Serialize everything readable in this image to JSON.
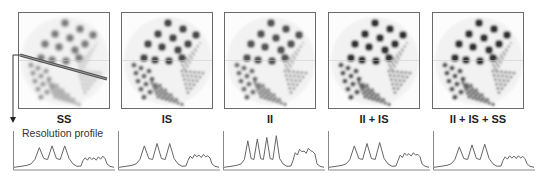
{
  "figure": {
    "profile_title": "Resolution profile",
    "panels": [
      {
        "id": "ss",
        "label": "SS",
        "x": 18,
        "contrast": 0.55,
        "blur": 1.4
      },
      {
        "id": "is",
        "label": "IS",
        "x": 121,
        "contrast": 0.75,
        "blur": 1.1
      },
      {
        "id": "ii",
        "label": "II",
        "x": 224,
        "contrast": 0.7,
        "blur": 0.9
      },
      {
        "id": "ii-is",
        "label": "II + IS",
        "x": 328,
        "contrast": 0.85,
        "blur": 0.9
      },
      {
        "id": "ii-is-ss",
        "label": "II + IS + SS",
        "x": 432,
        "contrast": 0.85,
        "blur": 1.0
      }
    ],
    "profiles": [
      {
        "id": "ss",
        "x": 13,
        "peaks": [
          0.6,
          0.65,
          0.65
        ],
        "minor": [
          0.3,
          0.32,
          0.3,
          0.33,
          0.35
        ]
      },
      {
        "id": "is",
        "x": 118,
        "peaks": [
          0.65,
          0.72,
          0.72
        ],
        "minor": [
          0.35,
          0.4,
          0.38,
          0.4,
          0.36
        ]
      },
      {
        "id": "ii",
        "x": 223,
        "peaks": [
          0.8,
          0.85,
          0.9,
          0.95
        ],
        "minor": [
          0.45,
          0.55,
          0.5,
          0.58,
          0.48
        ]
      },
      {
        "id": "ii-is",
        "x": 328,
        "peaks": [
          0.65,
          0.72,
          0.75
        ],
        "minor": [
          0.38,
          0.44,
          0.42,
          0.45,
          0.4
        ]
      },
      {
        "id": "ii-is-ss",
        "x": 433,
        "peaks": [
          0.62,
          0.68,
          0.7
        ],
        "minor": [
          0.33,
          0.36,
          0.35,
          0.36,
          0.34
        ]
      }
    ],
    "colors": {
      "frame": "#6a6a6a",
      "line": "#555555",
      "text": "#222222",
      "profile_line": "#666666"
    }
  }
}
